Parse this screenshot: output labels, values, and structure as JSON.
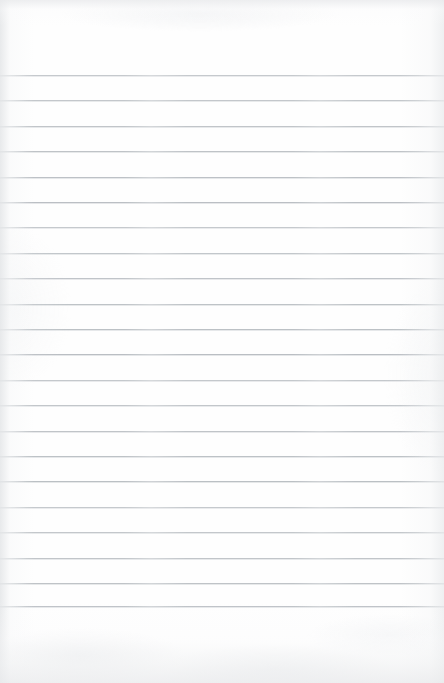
{
  "document": {
    "kind": "scanned-lined-paper",
    "title": "Blank Ruled Notebook Page",
    "page_width": 444,
    "page_height": 683,
    "written_text": "",
    "background_color": "#fefefe",
    "rule_color": "#b6bbc0",
    "rule_thickness_px": 1,
    "first_rule_y": 75,
    "rule_spacing_px": 25.4,
    "rule_count": 22,
    "top_margin_px": 75,
    "bottom_margin_px": 77,
    "left_margin_px": 0,
    "right_margin_px": 0,
    "has_vertical_margin_rule": false,
    "rule_y_positions": [
      75,
      100.4,
      125.8,
      151.2,
      176.6,
      202,
      227.4,
      252.8,
      278.2,
      303.6,
      329,
      354.4,
      379.8,
      405.2,
      430.6,
      456,
      481.4,
      506.8,
      532.2,
      557.6,
      583,
      606.4
    ]
  }
}
